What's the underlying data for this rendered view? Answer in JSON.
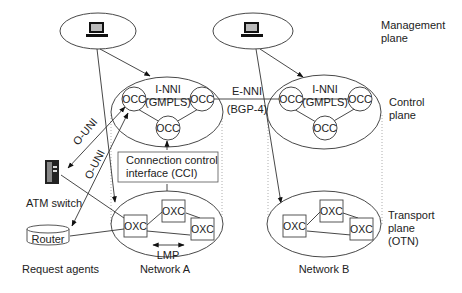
{
  "plane_labels": {
    "management": [
      "Management",
      "plane"
    ],
    "control": [
      "Control",
      "plane"
    ],
    "transport": [
      "Transport",
      "plane",
      "(OTN)"
    ]
  },
  "interfaces": {
    "inni_a": [
      "I-NNI",
      "(GMPLS)"
    ],
    "inni_b": [
      "I-NNI",
      "(GMPLS)"
    ],
    "enni": [
      "E-NNI",
      "(BGP-4)"
    ],
    "ouni_1": "O-UNI",
    "ouni_2": "O-UNI",
    "cci": [
      "Connection control",
      "interface (CCI)"
    ],
    "lmp": "LMP"
  },
  "nodes": {
    "occ": "OCC",
    "oxc": "OXC"
  },
  "agents": {
    "atm": "ATM switch",
    "router": "Router",
    "caption": "Request agents"
  },
  "networks": {
    "a": "Network A",
    "b": "Network B"
  },
  "icons": {
    "management_terminal": "computer-terminal-icon",
    "atm_switch": "atm-switch-icon",
    "router": "router-cylinder-icon"
  }
}
